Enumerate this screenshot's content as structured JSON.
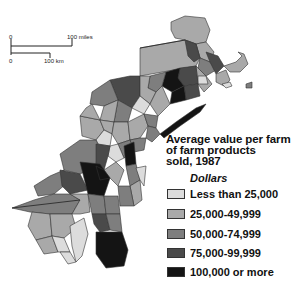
{
  "scale_bar": {
    "miles_zero": "0",
    "miles_label": "100 miles",
    "km_zero": "0",
    "km_label": "100 km"
  },
  "legend": {
    "title_line1": "Average value per farm",
    "title_line2": "of farm products",
    "title_line3": "sold, 1987",
    "units": "Dollars",
    "items": [
      {
        "label": "Less than 25,000",
        "color": "#dcdcdc"
      },
      {
        "label": "25,000-49,999",
        "color": "#a9a9a9"
      },
      {
        "label": "50,000-74,999",
        "color": "#7e7e7e"
      },
      {
        "label": "75,000-99,999",
        "color": "#4a4a4a"
      },
      {
        "label": "100,000 or more",
        "color": "#141414"
      }
    ]
  }
}
